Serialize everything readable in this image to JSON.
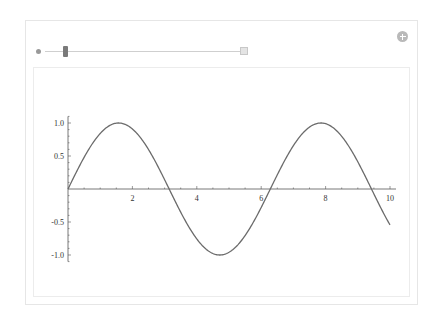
{
  "manipulate": {
    "controls": {
      "slider": {
        "variable_icon": "dot",
        "value_fraction": 0.15,
        "expand_button": "plus-box-icon"
      },
      "add_button": "plus-circle-icon"
    }
  },
  "chart_data": {
    "type": "line",
    "title": "",
    "xlabel": "",
    "ylabel": "",
    "function": "sin(x)",
    "xlim": [
      0,
      10
    ],
    "ylim": [
      -1.1,
      1.1
    ],
    "x_ticks": [
      2,
      4,
      6,
      8,
      10
    ],
    "x_tick_labels": [
      "2",
      "4",
      "6",
      "8",
      "10"
    ],
    "y_ticks": [
      -1.0,
      -0.5,
      0.5,
      1.0
    ],
    "y_tick_labels": [
      "-1.0",
      "-0.5",
      "0.5",
      "1.0"
    ],
    "grid": false,
    "legend": null,
    "series": [
      {
        "name": "sin(x)",
        "color": "#6b6b6b",
        "x": [
          0,
          0.5,
          1,
          1.5708,
          2,
          2.5,
          3,
          3.1416,
          3.5,
          4,
          4.5,
          4.7124,
          5,
          5.5,
          6,
          6.2832,
          6.5,
          7,
          7.5,
          7.854,
          8,
          8.5,
          9,
          9.4248,
          9.5,
          10
        ],
        "y": [
          0,
          0.479,
          0.841,
          1.0,
          0.909,
          0.598,
          0.141,
          0.0,
          -0.351,
          -0.757,
          -0.978,
          -1.0,
          -0.959,
          -0.706,
          -0.279,
          0.0,
          0.215,
          0.657,
          0.938,
          1.0,
          0.989,
          0.798,
          0.412,
          0.0,
          -0.075,
          -0.544
        ]
      }
    ]
  }
}
